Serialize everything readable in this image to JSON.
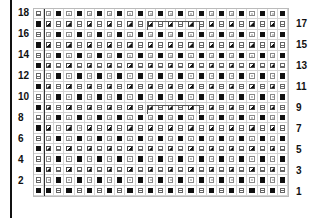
{
  "chart": {
    "columns": 25,
    "rows": 18,
    "legend_codes": {
      "B": "filled-black-square",
      "H": "box-with-horizontal-bar",
      "X": "box-with-circle",
      "D": "diagonal-half-filled-square"
    },
    "grid_rows_top_to_bottom": [
      {
        "row": 18,
        "cells": "HXBXBXBXBXBXBXBXBXBXBXBXB"
      },
      {
        "row": 17,
        "cells": "BDHDHDHDHDHDHDHDHDHDHDHDH"
      },
      {
        "row": 16,
        "cells": "HXBXBXBXBXBXBXBXBXBXBXBXB"
      },
      {
        "row": 15,
        "cells": "BDHDHDHDHDHDHDHDHDHDHDHDH"
      },
      {
        "row": 14,
        "cells": "HXBXBXBXBXBXBXBXBXBXBXBXB"
      },
      {
        "row": 13,
        "cells": "BDHDHDHDHDHDHDHDHDHDHDHDH"
      },
      {
        "row": 12,
        "cells": "HXBXBXBXBXBXBXBXBXBXBXBXB"
      },
      {
        "row": 11,
        "cells": "BDHDHDHDHDHDHDHDHDHDHDHDH"
      },
      {
        "row": 10,
        "cells": "HXBXBXBXBXBXBXBXBXBXBXBXB"
      },
      {
        "row": 9,
        "cells": "BDHDHDHDHDHDHDHDHDHDHDHDH"
      },
      {
        "row": 8,
        "cells": "HXBXBXBXBXBXBXBXBXBXBXBXB"
      },
      {
        "row": 7,
        "cells": "BDXDXDHDHDHDHDHDHDHDHDHDH"
      },
      {
        "row": 6,
        "cells": "HXBXBXBXBXBXBXBXBXBXBXBXB"
      },
      {
        "row": 5,
        "cells": "BDHDHDHDHDHDHDHDHDHDHDHDH"
      },
      {
        "row": 4,
        "cells": "HXBXBXBXBXBXBXBXBXBXBXBXB"
      },
      {
        "row": 3,
        "cells": "BDHDHDHDHDHDHDHDHDHDHDHDH"
      },
      {
        "row": 2,
        "cells": "HXBXBXBXBXBXBXBXBXBXBXBXB"
      },
      {
        "row": 1,
        "cells": "BBHBHBHBHBHBHBHBHBHBHBHBH"
      }
    ],
    "left_labels": [
      "18",
      "16",
      "14",
      "12",
      "10",
      "8",
      "6",
      "4",
      "2"
    ],
    "right_labels": [
      "17",
      "15",
      "13",
      "11",
      "9",
      "7",
      "5",
      "3",
      "1"
    ],
    "brackets": [
      {
        "row": 17,
        "from_col": 12,
        "to_col": 16
      },
      {
        "row": 9,
        "from_col": 12,
        "to_col": 16
      }
    ]
  }
}
